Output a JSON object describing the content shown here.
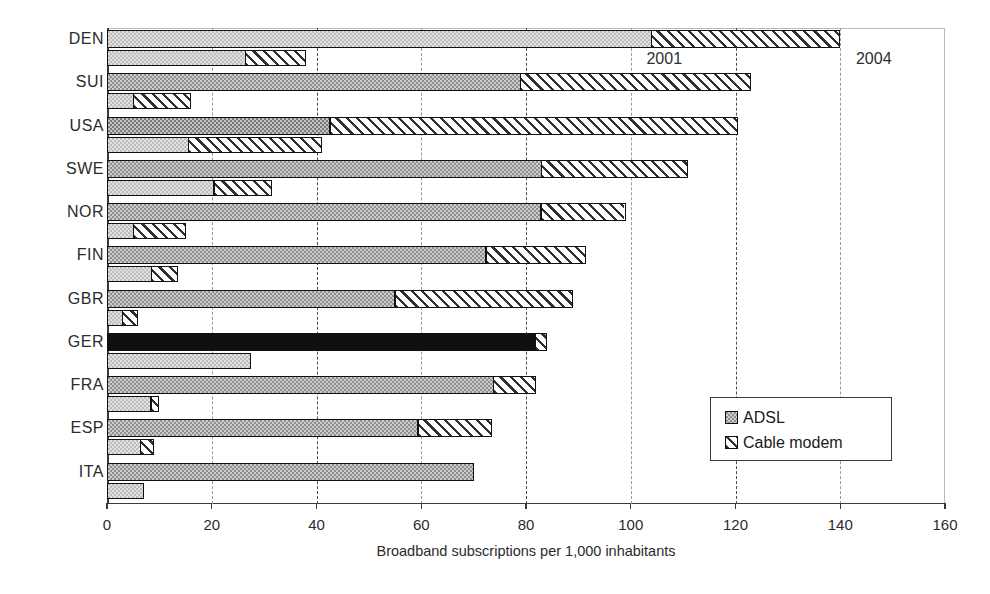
{
  "chart_data": {
    "type": "bar",
    "orientation": "horizontal",
    "title": "",
    "xlabel": "Broadband subscriptions per 1,000 inhabitants",
    "ylabel": "",
    "xlim": [
      0,
      160
    ],
    "xticks": [
      0,
      20,
      40,
      60,
      80,
      100,
      120,
      140,
      160
    ],
    "xtick_labels": [
      "0",
      "20",
      "40",
      "60",
      "80",
      "100",
      "120",
      "140",
      "160"
    ],
    "grid": "vertical-dashed",
    "legend_position": "lower-right",
    "legend_entries": [
      "ADSL",
      "Cable modem"
    ],
    "annotations": [
      {
        "text": "2001",
        "x": 103,
        "series_row": "DEN-2001"
      },
      {
        "text": "2004",
        "x": 143,
        "series_row": "DEN-2004"
      }
    ],
    "categories": [
      "DEN",
      "SUI",
      "USA",
      "SWE",
      "NOR",
      "FIN",
      "GBR",
      "GER",
      "FRA",
      "ESP",
      "ITA"
    ],
    "groups": [
      "2004",
      "2001"
    ],
    "series": [
      {
        "name": "ADSL",
        "year_2004": [
          104.0,
          79.0,
          42.5,
          83.0,
          83.0,
          72.5,
          55.0,
          82.0,
          74.0,
          59.5,
          70.0
        ],
        "year_2001": [
          26.5,
          5.0,
          15.5,
          20.5,
          5.0,
          8.5,
          3.0,
          27.5,
          8.5,
          6.5,
          7.0
        ]
      },
      {
        "name": "Cable modem",
        "year_2004": [
          36.0,
          44.0,
          78.0,
          28.0,
          16.0,
          19.0,
          34.0,
          2.0,
          8.0,
          14.0,
          0.0
        ],
        "year_2001": [
          11.5,
          11.0,
          25.5,
          11.0,
          10.0,
          5.0,
          3.0,
          0.0,
          1.5,
          2.5,
          0.0
        ]
      }
    ],
    "totals": {
      "year_2004": [
        140.0,
        123.0,
        120.5,
        111.0,
        99.0,
        91.5,
        89.0,
        84.0,
        82.0,
        73.5,
        70.0
      ],
      "year_2001": [
        38.0,
        16.0,
        41.0,
        31.5,
        15.0,
        13.5,
        6.0,
        27.5,
        10.0,
        9.0,
        7.0
      ]
    }
  },
  "legend": {
    "items": [
      {
        "label": "ADSL",
        "swatch": "adsl-swatch"
      },
      {
        "label": "Cable modem",
        "swatch": "cable-swatch"
      }
    ]
  },
  "axis": {
    "x_title": "Broadband subscriptions per 1,000 inhabitants"
  }
}
